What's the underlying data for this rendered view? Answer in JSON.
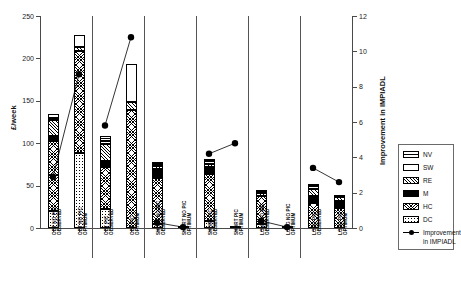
{
  "chart_data": {
    "type": "bar",
    "title": "",
    "subtitle": "",
    "ylabel": "£/week",
    "ylabel_right": "Improvement in IMPIADL",
    "xlabel": "",
    "ylim": [
      0,
      250
    ],
    "ylim_right": [
      0,
      12
    ],
    "yticks": [
      0,
      50,
      100,
      150,
      200,
      250
    ],
    "yticks_right": [
      0,
      2,
      4,
      6,
      8,
      10,
      12
    ],
    "grid": false,
    "legend_position": "right",
    "categories": [
      "OBT NO PIC OBSERVED",
      "OBT NO PIC OPTIMUM",
      "OBT PIC OBSERVED",
      "OBT PIC OPTIMUM",
      "SHORT NO PIC OBSERVED",
      "SHORT NO PIC OPTIMUM",
      "SHORT PIC OBSERVED",
      "SHORT PIC OPTIMUM",
      "LONG NO PIC OBSERVED",
      "LONG NO PIC OPTIMUM",
      "LONG PIC OBSERVED",
      "LONG PIC OPTIMUM"
    ],
    "group_separators_after": [
      2,
      4,
      6,
      8,
      10
    ],
    "series": [
      {
        "name": "DC",
        "key": "DC",
        "values": [
          20,
          89,
          22,
          0,
          5,
          0,
          8,
          0,
          5,
          0,
          0,
          0
        ]
      },
      {
        "name": "HC",
        "key": "HC",
        "values": [
          83,
          120,
          50,
          139,
          54,
          2,
          56,
          2,
          33,
          2,
          29,
          24
        ]
      },
      {
        "name": "M",
        "key": "M",
        "values": [
          6,
          0,
          7,
          0,
          11,
          0,
          8,
          0,
          0,
          0,
          9,
          8
        ]
      },
      {
        "name": "RE",
        "key": "RE",
        "values": [
          18,
          5,
          20,
          10,
          3,
          0,
          4,
          0,
          3,
          0,
          8,
          4
        ]
      },
      {
        "name": "SW",
        "key": "SW",
        "values": [
          3,
          14,
          4,
          45,
          3,
          0,
          3,
          0,
          2,
          0,
          3,
          2
        ]
      },
      {
        "name": "NV",
        "key": "NV",
        "values": [
          4,
          0,
          5,
          0,
          2,
          0,
          2,
          0,
          2,
          0,
          3,
          0
        ]
      }
    ],
    "marker_series": {
      "name": "Improvement in IMPIADL",
      "axis": "right",
      "values": [
        2.9,
        8.7,
        5.8,
        10.8,
        0.3,
        0.05,
        4.2,
        4.8,
        0.4,
        0.05,
        3.4,
        2.6
      ]
    }
  },
  "axes": {
    "left_title": "£/week",
    "right_title": "Improvement in IMPIADL",
    "left_ticks": [
      "0",
      "50",
      "100",
      "150",
      "200",
      "250"
    ],
    "right_ticks": [
      "0",
      "2",
      "4",
      "6",
      "8",
      "10",
      "12"
    ]
  },
  "legend": {
    "entries": [
      {
        "label": "NV",
        "pattern": "NV"
      },
      {
        "label": "SW",
        "pattern": "SW"
      },
      {
        "label": "RE",
        "pattern": "RE"
      },
      {
        "label": "M",
        "pattern": "M"
      },
      {
        "label": "HC",
        "pattern": "HC"
      },
      {
        "label": "DC",
        "pattern": "DC"
      }
    ],
    "marker_label_line1": "Improvement",
    "marker_label_line2": "in IMPIADL"
  },
  "x_labels": [
    {
      "line1": "OBT NO PIC",
      "line2": "OBSERVED"
    },
    {
      "line1": "OBT NO PIC",
      "line2": "OPTIMUM"
    },
    {
      "line1": "OBT PIC",
      "line2": "OBSERVED"
    },
    {
      "line1": "OBT PIC",
      "line2": "OPTIMUM"
    },
    {
      "line1": "SHORT NO PIC",
      "line2": "OBSERVED"
    },
    {
      "line1": "SHORT NO PIC",
      "line2": "OPTIMUM"
    },
    {
      "line1": "SHORT PIC",
      "line2": "OBSERVED"
    },
    {
      "line1": "SHORT PIC",
      "line2": "OPTIMUM"
    },
    {
      "line1": "LONG NO PIC",
      "line2": "OBSERVED"
    },
    {
      "line1": "LONG NO PIC",
      "line2": "OPTIMUM"
    },
    {
      "line1": "LONG PIC",
      "line2": "OBSERVED"
    },
    {
      "line1": "LONG PIC",
      "line2": "OPTIMUM"
    }
  ],
  "colors": {
    "axis": "#4a4a4a",
    "text": "#111111",
    "marker": "#000000",
    "background": "#ffffff"
  }
}
